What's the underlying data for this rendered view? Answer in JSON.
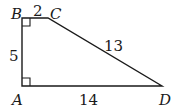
{
  "diagram": {
    "type": "trapezoid",
    "stroke_color": "#1a1a1a",
    "background": "#ffffff",
    "vertices": {
      "A": {
        "label": "A",
        "x": 22,
        "y": 86
      },
      "B": {
        "label": "B",
        "x": 22,
        "y": 18
      },
      "C": {
        "label": "C",
        "x": 48,
        "y": 18
      },
      "D": {
        "label": "D",
        "x": 162,
        "y": 86
      }
    },
    "sides": {
      "BC": {
        "label": "2"
      },
      "AB": {
        "label": "5"
      },
      "CD": {
        "label": "13"
      },
      "AD": {
        "label": "14"
      }
    },
    "right_angles": [
      "A",
      "B"
    ]
  }
}
